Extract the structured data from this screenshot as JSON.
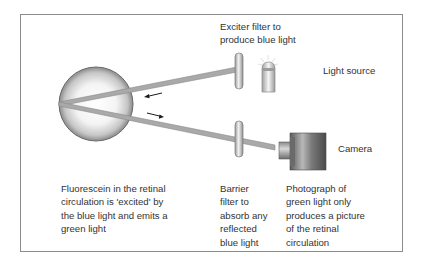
{
  "diagram": {
    "labels": {
      "exciter_filter": "Exciter filter to\nproduce blue light",
      "light_source": "Light source",
      "camera": "Camera",
      "fluorescein": "Fluorescein in the retinal\ncirculation is 'excited' by\nthe blue light and emits a\ngreen light",
      "barrier_filter": "Barrier\nfilter to\nabsorb any\nreflected\nblue light",
      "photograph": "Photograph of\ngreen light only\nproduces a picture\nof the retinal\ncirculation"
    },
    "components": [
      {
        "id": "eye",
        "icon": "eye-globe-icon"
      },
      {
        "id": "exciter-filter",
        "icon": "filter-icon"
      },
      {
        "id": "light-source",
        "icon": "light-bulb-icon"
      },
      {
        "id": "barrier-filter",
        "icon": "filter-icon"
      },
      {
        "id": "camera",
        "icon": "camera-icon"
      }
    ],
    "arrows": [
      {
        "id": "incoming-light",
        "direction": "left"
      },
      {
        "id": "outgoing-light",
        "direction": "right"
      }
    ],
    "colors": {
      "beam": "#a8a8a8",
      "frame": "#8c8c8c",
      "text": "#333333"
    }
  }
}
